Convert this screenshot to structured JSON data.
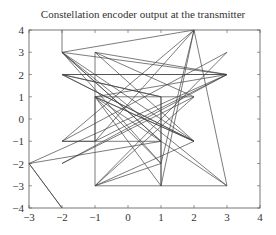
{
  "chart_data": {
    "type": "line",
    "title": "Constellation encoder output at the transmitter",
    "xlabel": "",
    "ylabel": "",
    "xlim": [
      -3,
      4
    ],
    "ylim": [
      -4,
      4
    ],
    "grid": false,
    "xticks": [
      "-3",
      "-2",
      "-1",
      "0",
      "1",
      "2",
      "3",
      "4"
    ],
    "yticks": [
      "4",
      "3",
      "2",
      "1",
      "0",
      "-1",
      "-2",
      "-3",
      "-4"
    ],
    "points": [
      [
        -2,
        4
      ],
      [
        -2,
        3
      ],
      [
        2,
        4
      ],
      [
        1,
        -2
      ],
      [
        -1,
        1
      ],
      [
        3,
        2
      ],
      [
        -2,
        2
      ],
      [
        2,
        -1
      ],
      [
        -1,
        3
      ],
      [
        -1,
        -3
      ],
      [
        3,
        3
      ],
      [
        -2,
        -1
      ],
      [
        1,
        -1
      ],
      [
        -2,
        3
      ],
      [
        2,
        -1
      ],
      [
        -1,
        1
      ],
      [
        -1,
        -1
      ],
      [
        3,
        2
      ],
      [
        -3,
        -2
      ],
      [
        -2,
        -4
      ],
      [
        -3,
        -2
      ],
      [
        1,
        -1
      ],
      [
        -2,
        3
      ],
      [
        1,
        -2
      ],
      [
        -1,
        -3
      ],
      [
        2,
        -1
      ],
      [
        -2,
        2
      ],
      [
        1,
        1
      ],
      [
        1,
        -3
      ],
      [
        -1,
        1
      ],
      [
        2,
        1
      ],
      [
        -2,
        -2
      ],
      [
        3,
        2
      ],
      [
        -2,
        3
      ],
      [
        3,
        -3
      ],
      [
        2,
        4
      ],
      [
        -1,
        -1
      ],
      [
        -2,
        -1
      ],
      [
        2,
        4
      ],
      [
        1,
        -3
      ],
      [
        1,
        1
      ],
      [
        -2,
        2
      ],
      [
        3,
        2
      ],
      [
        -1,
        3
      ],
      [
        2,
        1
      ],
      [
        -1,
        -3
      ],
      [
        3,
        -3
      ],
      [
        -1,
        1
      ],
      [
        2,
        -1
      ]
    ]
  }
}
